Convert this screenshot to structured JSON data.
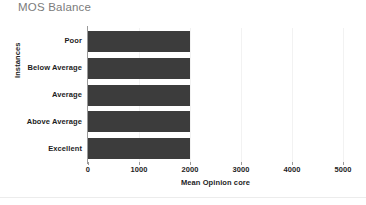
{
  "chart_data": {
    "type": "bar",
    "orientation": "horizontal",
    "title": "MOS Balance",
    "xlabel": "Mean Opinion core",
    "ylabel": "Instances",
    "categories": [
      "Poor",
      "Below Average",
      "Average",
      "Above Average",
      "Excellent"
    ],
    "values": [
      2000,
      2000,
      2000,
      2000,
      2000
    ],
    "xlim": [
      0,
      5000
    ],
    "xticks": [
      0,
      1000,
      2000,
      3000,
      4000,
      5000
    ],
    "xtick_labels": [
      "0",
      "1000",
      "2000",
      "3000",
      "4000",
      "5000"
    ],
    "grid": true,
    "legend": "none",
    "series": [
      {
        "name": "Instances",
        "values": [
          2000,
          2000,
          2000,
          2000,
          2000
        ]
      }
    ],
    "colors": {
      "bar": "#3c3c3c",
      "title": "#7b7b7b",
      "axis": "#9a9a9a",
      "gridline": "#f2f2f2",
      "text": "#1d1d1d",
      "background": "#ffffff"
    }
  }
}
